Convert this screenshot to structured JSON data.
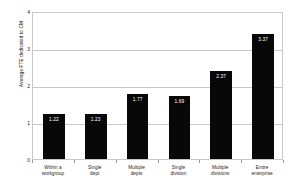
{
  "chart_data": {
    "type": "bar",
    "title": "",
    "xlabel": "",
    "ylabel": "Average FTE dedicated to CM",
    "categories": [
      "Within a workgroup",
      "Single dept",
      "Multiple depts",
      "Single division",
      "Multiple divisions",
      "Entire enterprise"
    ],
    "category_lines": [
      [
        "Within a",
        "workgroup"
      ],
      [
        "Single",
        "dept"
      ],
      [
        "Multiple",
        "depts"
      ],
      [
        "Single",
        "division"
      ],
      [
        "Multiple",
        "divisions"
      ],
      [
        "Entire",
        "enterprise"
      ]
    ],
    "values": [
      1.22,
      1.23,
      1.77,
      1.69,
      2.37,
      3.37
    ],
    "value_labels": [
      "1.22",
      "1.23",
      "1.77",
      "1.69",
      "2.37",
      "3.37"
    ],
    "ylim": [
      0,
      4
    ],
    "ytick_labels": [
      "0",
      "1",
      "2",
      "3",
      "4"
    ],
    "ytick_values": [
      0,
      1,
      2,
      3,
      4
    ],
    "grid": true,
    "legend": false,
    "bar_color": "#080808",
    "grid_color": "#c8c8c8",
    "label_color": "#ffffff",
    "background": "#ffffff"
  }
}
